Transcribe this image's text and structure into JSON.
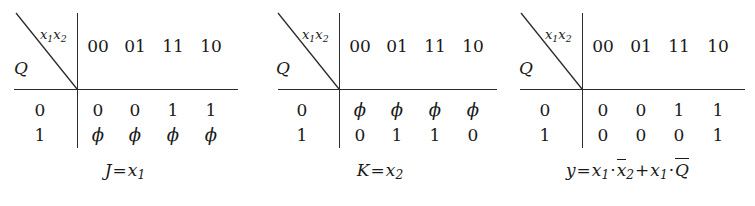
{
  "figure": {
    "type": "karnaugh-style-truth-tables",
    "table_count": 3
  },
  "tables": [
    {
      "id": "J",
      "corner_top_label": "x₁x₂",
      "corner_bottom_label": "Q",
      "column_headers": [
        "00",
        "01",
        "11",
        "10"
      ],
      "row_headers": [
        "0",
        "1"
      ],
      "rows": [
        [
          "0",
          "0",
          "1",
          "1"
        ],
        [
          "ϕ",
          "ϕ",
          "ϕ",
          "ϕ"
        ]
      ],
      "caption": {
        "lhs": "J",
        "eq": "=",
        "rhs_parts": [
          {
            "kind": "var",
            "base": "x",
            "sub": "1",
            "bar": false
          }
        ],
        "plain": "J = x₁"
      }
    },
    {
      "id": "K",
      "corner_top_label": "x₁x₂",
      "corner_bottom_label": "Q",
      "column_headers": [
        "00",
        "01",
        "11",
        "10"
      ],
      "row_headers": [
        "0",
        "1"
      ],
      "rows": [
        [
          "ϕ",
          "ϕ",
          "ϕ",
          "ϕ"
        ],
        [
          "0",
          "1",
          "1",
          "0"
        ]
      ],
      "caption": {
        "lhs": "K",
        "eq": "=",
        "rhs_parts": [
          {
            "kind": "var",
            "base": "x",
            "sub": "2",
            "bar": false
          }
        ],
        "plain": "K = x₂"
      }
    },
    {
      "id": "y",
      "corner_top_label": "x₁x₂",
      "corner_bottom_label": "Q",
      "column_headers": [
        "00",
        "01",
        "11",
        "10"
      ],
      "row_headers": [
        "0",
        "1"
      ],
      "rows": [
        [
          "0",
          "0",
          "1",
          "1"
        ],
        [
          "0",
          "0",
          "0",
          "1"
        ]
      ],
      "caption": {
        "lhs": "y",
        "eq": "=",
        "rhs_parts": [
          {
            "kind": "var",
            "base": "x",
            "sub": "1",
            "bar": false
          },
          {
            "kind": "dot",
            "base": "·"
          },
          {
            "kind": "var",
            "base": "x",
            "sub": "2",
            "bar": true
          },
          {
            "kind": "plus",
            "base": "+"
          },
          {
            "kind": "var",
            "base": "x",
            "sub": "1",
            "bar": false
          },
          {
            "kind": "dot",
            "base": "·"
          },
          {
            "kind": "var",
            "base": "Q",
            "sub": "",
            "bar": true
          }
        ],
        "plain": "y = x₁·x̄₂ + x₁·Q̄"
      }
    }
  ],
  "symbols": {
    "dont_care": "ϕ",
    "multiply": "·",
    "plus": "+",
    "equals": "="
  },
  "colors": {
    "ink": "#1a1a1a",
    "rule": "#2b2b2b",
    "background": "#ffffff"
  }
}
